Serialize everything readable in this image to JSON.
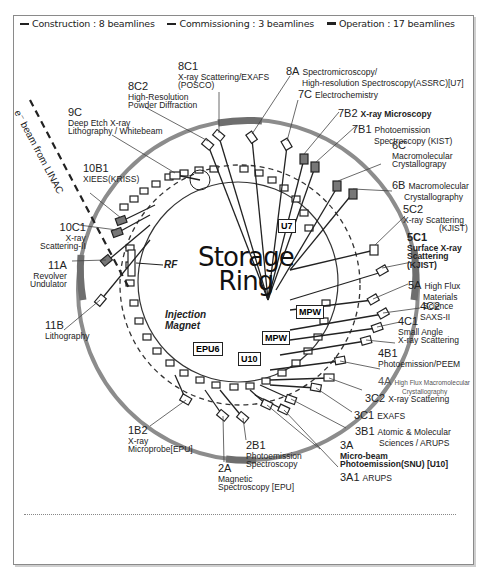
{
  "legend": {
    "items": [
      {
        "symbol": "dashed-line",
        "label": "Construction : 8 beamlines"
      },
      {
        "symbol": "solid-line",
        "label": "Commissioning : 3 beamlines"
      },
      {
        "symbol": "solid-line-thick",
        "label": "Operation : 17 beamlines"
      }
    ]
  },
  "center": {
    "line1": "Storage",
    "line2": "Ring"
  },
  "linac_label": "e⁻ beam from LINAC",
  "components": {
    "rf": "RF",
    "injection_line1": "Injection",
    "injection_line2": "Magnet"
  },
  "insertion_devices": [
    {
      "id": "u7",
      "label": "U7"
    },
    {
      "id": "mpw1",
      "label": "MPW"
    },
    {
      "id": "mpw2",
      "label": "MPW"
    },
    {
      "id": "epu6",
      "label": "EPU6"
    },
    {
      "id": "u10",
      "label": "U10"
    }
  ],
  "beamlines": [
    {
      "code": "8C1",
      "desc": [
        "X-ray Scattering/EXAFS",
        "(POSCO)"
      ]
    },
    {
      "code": "8A",
      "desc": [
        "Spectromicroscopy/",
        "High-resolution Spectroscopy(ASSRC)[U7]"
      ]
    },
    {
      "code": "7C",
      "desc": [
        "Electrochemistry"
      ]
    },
    {
      "code": "8C2",
      "desc": [
        "High-Resolution",
        "Powder Diffraction"
      ]
    },
    {
      "code": "7B2",
      "desc": [
        "X-ray  Microscopy"
      ]
    },
    {
      "code": "7B1",
      "desc": [
        "Photoemission",
        "Spectroscopy (KIST)"
      ]
    },
    {
      "code": "9C",
      "desc": [
        "Deep Etch X-ray",
        "Lithography / Whitebeam"
      ]
    },
    {
      "code": "6C",
      "desc": [
        "Macromolecular",
        "Crystallograpy"
      ]
    },
    {
      "code": "10B1",
      "desc": [
        "XIEES(KRISS)"
      ]
    },
    {
      "code": "6B",
      "desc": [
        "Macromolecular",
        "Crystallography"
      ]
    },
    {
      "code": "5C2",
      "desc": [
        "X-ray Scattering",
        "(KJIST)"
      ]
    },
    {
      "code": "10C1",
      "desc": [
        "X-ray",
        "Scattering-II"
      ]
    },
    {
      "code": "5C1",
      "desc": [
        "Surface X-ray",
        "Scattering",
        "(KJIST)"
      ]
    },
    {
      "code": "11A",
      "desc": [
        "Revolver",
        "Undulator"
      ]
    },
    {
      "code": "5A",
      "desc": [
        "High Flux",
        "Materials",
        "Science"
      ]
    },
    {
      "code": "4C2",
      "desc": [
        "SAXS-II"
      ]
    },
    {
      "code": "11B",
      "desc": [
        "Lithography"
      ]
    },
    {
      "code": "4C1",
      "desc": [
        "Small Angle",
        "X-ray Scattering"
      ]
    },
    {
      "code": "4B1",
      "desc": [
        "Photoemission/PEEM"
      ]
    },
    {
      "code": "4A",
      "desc": [
        "High Flux Macromolecular",
        "Crystallography"
      ]
    },
    {
      "code": "3C2",
      "desc": [
        "X-ray Scattering"
      ]
    },
    {
      "code": "3C1",
      "desc": [
        "EXAFS"
      ]
    },
    {
      "code": "1B2",
      "desc": [
        "X-ray",
        "Microprobe[EPU]"
      ]
    },
    {
      "code": "3B1",
      "desc": [
        "Atomic & Molecular",
        "Sciences / ARUPS"
      ]
    },
    {
      "code": "3A",
      "desc": [
        "Micro-beam",
        "Photoemission(SNU) [U10]"
      ]
    },
    {
      "code": "2B1",
      "desc": [
        "Photoemission",
        "Spectroscopy"
      ]
    },
    {
      "code": "2A",
      "desc": [
        "Magnetic",
        "Spectroscopy [EPU]"
      ]
    },
    {
      "code": "3A1",
      "desc": [
        "ARUPS"
      ]
    }
  ],
  "colors": {
    "ring": "#8c8c8c",
    "ink": "#222222",
    "segment": "#6e6e6e"
  }
}
